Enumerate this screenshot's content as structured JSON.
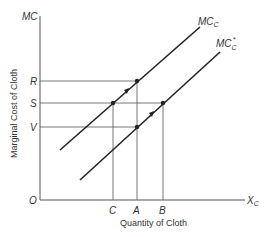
{
  "diagram": {
    "y_axis_label": "MC",
    "y_axis_title": "Marginal Cost of Cloth",
    "x_axis_label": "X",
    "x_axis_label_sub": "C",
    "x_axis_title": "Quantity of Cloth",
    "origin_label": "O",
    "y_ticks": [
      {
        "label": "R",
        "y": 81
      },
      {
        "label": "S",
        "y": 103
      },
      {
        "label": "V",
        "y": 127
      }
    ],
    "x_ticks": [
      {
        "label": "C",
        "x": 113
      },
      {
        "label": "A",
        "x": 137
      },
      {
        "label": "B",
        "x": 163
      }
    ],
    "curves": [
      {
        "name": "MC",
        "sub": "C",
        "sup": "",
        "x1": 60,
        "y1": 150,
        "x2": 200,
        "y2": 27
      },
      {
        "name": "MC",
        "sub": "C",
        "sup": "*",
        "x1": 80,
        "y1": 180,
        "x2": 220,
        "y2": 52
      }
    ],
    "colors": {
      "line": "#222222",
      "guide": "#555555",
      "text": "#333333"
    }
  }
}
